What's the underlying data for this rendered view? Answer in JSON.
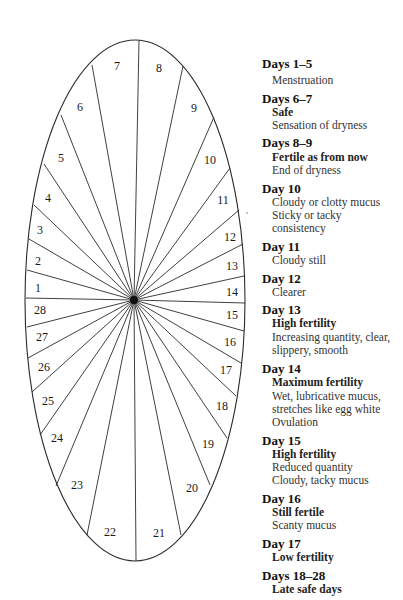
{
  "diagram": {
    "ellipse": {
      "cx": 135,
      "cy": 300.5,
      "rx": 110,
      "ry": 260.5
    },
    "center_dot": {
      "cx": 134,
      "cy": 300,
      "r": 4
    },
    "line_color": "#2a2a2a",
    "spokes": [
      {
        "between": "7/8",
        "x": 139,
        "y": 40
      },
      {
        "between": "8/9",
        "x": 183,
        "y": 66
      },
      {
        "between": "9/10",
        "x": 214,
        "y": 117
      },
      {
        "between": "10/11",
        "x": 230,
        "y": 168
      },
      {
        "between": "11/12",
        "x": 239,
        "y": 210
      },
      {
        "between": "12/13",
        "x": 243,
        "y": 244
      },
      {
        "between": "13/14",
        "x": 244,
        "y": 276
      },
      {
        "between": "14/15",
        "x": 245,
        "y": 303
      },
      {
        "between": "15/16",
        "x": 244,
        "y": 331
      },
      {
        "between": "16/17",
        "x": 241,
        "y": 363
      },
      {
        "between": "17/18",
        "x": 236,
        "y": 396
      },
      {
        "between": "18/19",
        "x": 227,
        "y": 438
      },
      {
        "between": "19/20",
        "x": 210,
        "y": 485
      },
      {
        "between": "20/21",
        "x": 181,
        "y": 535
      },
      {
        "between": "21/22",
        "x": 136,
        "y": 561
      },
      {
        "between": "22/23",
        "x": 87,
        "y": 535
      },
      {
        "between": "23/24",
        "x": 56,
        "y": 486
      },
      {
        "between": "24/25",
        "x": 40,
        "y": 435
      },
      {
        "between": "25/26",
        "x": 32,
        "y": 392
      },
      {
        "between": "26/27",
        "x": 28,
        "y": 358
      },
      {
        "between": "27/28",
        "x": 27,
        "y": 327
      },
      {
        "between": "28/1",
        "x": 26,
        "y": 298
      },
      {
        "between": "1/2",
        "x": 27,
        "y": 270
      },
      {
        "between": "2/3",
        "x": 29,
        "y": 239
      },
      {
        "between": "3/4",
        "x": 34,
        "y": 205
      },
      {
        "between": "4/5",
        "x": 44,
        "y": 164
      },
      {
        "between": "5/6",
        "x": 61,
        "y": 115
      },
      {
        "between": "6/7",
        "x": 92,
        "y": 65
      }
    ],
    "day_labels": [
      {
        "text": "1",
        "x": 38,
        "y": 288
      },
      {
        "text": "2",
        "x": 38,
        "y": 261
      },
      {
        "text": "3",
        "x": 40,
        "y": 230
      },
      {
        "text": "4",
        "x": 48,
        "y": 198
      },
      {
        "text": "5",
        "x": 61,
        "y": 158
      },
      {
        "text": "6",
        "x": 80,
        "y": 107
      },
      {
        "text": "7",
        "x": 117,
        "y": 66
      },
      {
        "text": "8",
        "x": 159,
        "y": 68
      },
      {
        "text": "9",
        "x": 194,
        "y": 108
      },
      {
        "text": "10",
        "x": 210,
        "y": 160
      },
      {
        "text": "11",
        "x": 223,
        "y": 200
      },
      {
        "text": "12",
        "x": 230,
        "y": 237
      },
      {
        "text": "13",
        "x": 232,
        "y": 266
      },
      {
        "text": "14",
        "x": 232,
        "y": 292
      },
      {
        "text": "15",
        "x": 232,
        "y": 315
      },
      {
        "text": "16",
        "x": 230,
        "y": 342
      },
      {
        "text": "17",
        "x": 226,
        "y": 370
      },
      {
        "text": "18",
        "x": 222,
        "y": 406
      },
      {
        "text": "19",
        "x": 208,
        "y": 444
      },
      {
        "text": "20",
        "x": 192,
        "y": 488
      },
      {
        "text": "21",
        "x": 159,
        "y": 533
      },
      {
        "text": "22",
        "x": 110,
        "y": 532
      },
      {
        "text": "23",
        "x": 77,
        "y": 485
      },
      {
        "text": "24",
        "x": 57,
        "y": 438
      },
      {
        "text": "25",
        "x": 48,
        "y": 401
      },
      {
        "text": "26",
        "x": 44,
        "y": 367
      },
      {
        "text": "27",
        "x": 42,
        "y": 337
      },
      {
        "text": "28",
        "x": 40,
        "y": 310
      }
    ],
    "stray_mark": {
      "x": 247,
      "y": 213
    }
  },
  "legend": {
    "entries": [
      {
        "heading": "Days 1–5",
        "heading_y": 57,
        "lines": [
          {
            "text": "Menstruation",
            "style": "sub",
            "y": 75
          }
        ]
      },
      {
        "heading": "Days 6–7",
        "heading_y": 92,
        "lines": [
          {
            "text": "Safe",
            "style": "sub-bold",
            "y": 107
          },
          {
            "text": "Sensation of dryness",
            "style": "sub",
            "y": 120
          }
        ]
      },
      {
        "heading": "Days 8–9",
        "heading_y": 136,
        "lines": [
          {
            "text": "Fertile as from now",
            "style": "sub-bold",
            "y": 152
          },
          {
            "text": "End of dryness",
            "style": "sub",
            "y": 165
          }
        ]
      },
      {
        "heading": "Day 10",
        "heading_y": 182,
        "lines": [
          {
            "text": "Cloudy or clotty mucus",
            "style": "sub",
            "y": 197
          },
          {
            "text": "Sticky or tacky",
            "style": "sub",
            "y": 210
          },
          {
            "text": "consistency",
            "style": "sub",
            "y": 223
          }
        ]
      },
      {
        "heading": "Day 11",
        "heading_y": 240,
        "lines": [
          {
            "text": "Cloudy still",
            "style": "sub",
            "y": 255
          }
        ]
      },
      {
        "heading": "Day 12",
        "heading_y": 272,
        "lines": [
          {
            "text": "Clearer",
            "style": "sub",
            "y": 287
          }
        ]
      },
      {
        "heading": "Day 13",
        "heading_y": 303,
        "lines": [
          {
            "text": "High fertility",
            "style": "sub-bold",
            "y": 318
          },
          {
            "text": "Increasing quantity, clear,",
            "style": "sub",
            "y": 332
          },
          {
            "text": "slippery, smooth",
            "style": "sub",
            "y": 345
          }
        ]
      },
      {
        "heading": "Day 14",
        "heading_y": 362,
        "lines": [
          {
            "text": "Maximum fertility",
            "style": "sub-bold",
            "y": 377
          },
          {
            "text": "Wet, lubricative mucus,",
            "style": "sub",
            "y": 391
          },
          {
            "text": "stretches like egg white",
            "style": "sub",
            "y": 404
          },
          {
            "text": "Ovulation",
            "style": "sub",
            "y": 417
          }
        ]
      },
      {
        "heading": "Day 15",
        "heading_y": 434,
        "lines": [
          {
            "text": "High fertility",
            "style": "sub-bold",
            "y": 449
          },
          {
            "text": "Reduced quantity",
            "style": "sub",
            "y": 462
          },
          {
            "text": "Cloudy, tacky mucus",
            "style": "sub",
            "y": 475
          }
        ]
      },
      {
        "heading": "Day 16",
        "heading_y": 492,
        "lines": [
          {
            "text": "Still fertile",
            "style": "sub-bold",
            "y": 507
          },
          {
            "text": "Scanty mucus",
            "style": "sub",
            "y": 520
          }
        ]
      },
      {
        "heading": "Day 17",
        "heading_y": 537,
        "lines": [
          {
            "text": "Low fertility",
            "style": "sub-bold",
            "y": 552
          }
        ]
      },
      {
        "heading": "Days 18–28",
        "heading_y": 569,
        "lines": [
          {
            "text": "Late safe days",
            "style": "sub-bold",
            "y": 584
          }
        ]
      }
    ]
  }
}
